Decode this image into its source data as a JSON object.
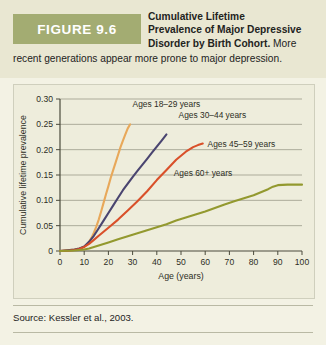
{
  "figure": {
    "badge_label": "FIGURE 9.6",
    "title_bold": "Cumulative Lifetime Prevalence of Major Depressive Disorder by Birth Cohort.",
    "title_line1": "Cumulative Lifetime",
    "title_line2": "Prevalence of Major Depressive",
    "title_line3": "Disorder by Birth Cohort.",
    "title_tail": "More",
    "caption_rest": "recent generations appear more prone to major depression.",
    "source": "Source: Kessler et al., 2003.",
    "badge_bg": "#a3ac72",
    "header_bg": "#e9e7d2",
    "page_bg": "#f3f2e4",
    "card_bg": "#eeeddc"
  },
  "chart_data": {
    "type": "line",
    "title": "Cumulative Lifetime Prevalence of Major Depressive Disorder by Birth Cohort",
    "xlabel": "Age (years)",
    "ylabel": "Cumulative lifetime prevalence",
    "xlim": [
      0,
      100
    ],
    "ylim": [
      0,
      0.3
    ],
    "xticks": [
      0,
      10,
      20,
      30,
      40,
      50,
      60,
      70,
      80,
      90,
      100
    ],
    "xtick_labels": [
      "0",
      "10",
      "20",
      "30",
      "40",
      "50",
      "60",
      "70",
      "80",
      "90",
      "100"
    ],
    "yticks": [
      0,
      0.05,
      0.1,
      0.15,
      0.2,
      0.25,
      0.3
    ],
    "ytick_labels": [
      "0",
      "0.05",
      "0.10",
      "0.15",
      "0.20",
      "0.25",
      "0.30"
    ],
    "grid": "horizontal",
    "legend": "inline-annotations",
    "series": [
      {
        "name": "Ages 18-29 years",
        "label": "Ages 18–29 years",
        "color": "#e8a85a",
        "label_x": 30,
        "label_y": 0.285,
        "x": [
          0,
          4,
          6,
          8,
          10,
          11,
          12,
          13,
          14,
          15,
          16,
          17,
          18,
          19,
          20,
          21,
          22,
          23,
          24,
          25,
          26,
          27,
          28,
          29
        ],
        "y": [
          0,
          0.002,
          0.003,
          0.005,
          0.008,
          0.012,
          0.018,
          0.026,
          0.036,
          0.048,
          0.062,
          0.078,
          0.095,
          0.112,
          0.128,
          0.145,
          0.16,
          0.175,
          0.19,
          0.205,
          0.218,
          0.23,
          0.242,
          0.25
        ]
      },
      {
        "name": "Ages 30-44 years",
        "label": "Ages 30–44 years",
        "color": "#4a4570",
        "label_x": 49,
        "label_y": 0.262,
        "x": [
          0,
          4,
          6,
          8,
          10,
          12,
          14,
          16,
          18,
          20,
          22,
          24,
          26,
          28,
          30,
          32,
          34,
          36,
          38,
          40,
          42,
          44
        ],
        "y": [
          0,
          0.002,
          0.003,
          0.005,
          0.009,
          0.018,
          0.03,
          0.045,
          0.06,
          0.075,
          0.09,
          0.105,
          0.12,
          0.133,
          0.146,
          0.158,
          0.17,
          0.182,
          0.194,
          0.206,
          0.218,
          0.23
        ]
      },
      {
        "name": "Ages 45-59 years",
        "label": "Ages 45–59 years",
        "color": "#d9502a",
        "label_x": 61,
        "label_y": 0.205,
        "x": [
          0,
          4,
          6,
          8,
          10,
          12,
          14,
          16,
          18,
          20,
          24,
          28,
          32,
          36,
          40,
          44,
          48,
          52,
          55,
          57,
          59
        ],
        "y": [
          0,
          0.001,
          0.002,
          0.004,
          0.008,
          0.014,
          0.022,
          0.03,
          0.038,
          0.046,
          0.062,
          0.08,
          0.098,
          0.118,
          0.14,
          0.16,
          0.18,
          0.196,
          0.205,
          0.209,
          0.212
        ]
      },
      {
        "name": "Ages 60+ years",
        "label": "Ages 60+ years",
        "color": "#93992f",
        "label_x": 47,
        "label_y": 0.148,
        "x": [
          0,
          6,
          10,
          12,
          14,
          16,
          18,
          20,
          24,
          28,
          32,
          36,
          40,
          44,
          48,
          52,
          56,
          60,
          64,
          68,
          72,
          76,
          80,
          84,
          86,
          88,
          90,
          94,
          100
        ],
        "y": [
          0,
          0.001,
          0.003,
          0.005,
          0.008,
          0.011,
          0.014,
          0.017,
          0.023,
          0.029,
          0.035,
          0.041,
          0.047,
          0.053,
          0.06,
          0.066,
          0.072,
          0.078,
          0.085,
          0.092,
          0.098,
          0.104,
          0.11,
          0.118,
          0.122,
          0.127,
          0.13,
          0.131,
          0.131
        ]
      }
    ]
  }
}
